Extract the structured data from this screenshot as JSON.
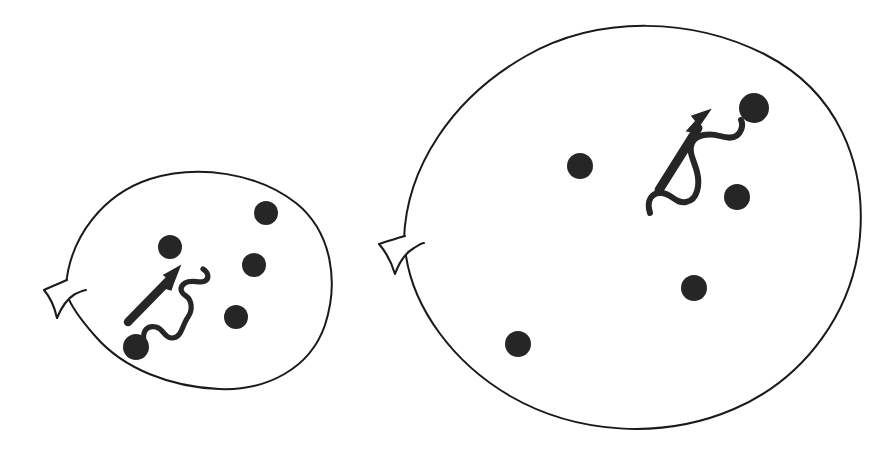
{
  "figure": {
    "background_color": "#ffffff",
    "ink_color": "#1a1a1a",
    "width": 892,
    "height": 453
  },
  "chart_data": {
    "type": "diagram",
    "xlabel": "",
    "ylabel": "",
    "legend": [],
    "annotations": [],
    "cells": [
      {
        "id": "small-cell",
        "label": "small oocyte",
        "shape": "ellipse",
        "center_x": 196,
        "center_y": 280,
        "radius_x": 134,
        "radius_y": 108,
        "rotation_deg": -8,
        "outline_color": "#1a1a1a",
        "outline_width": 2.0,
        "fill_color": "#ffffff",
        "notch": {
          "label": "membrane-notch",
          "x": 62,
          "y": 296,
          "depth": 22,
          "height": 34
        },
        "granules": [
          {
            "cx": 266,
            "cy": 213,
            "r": 12
          },
          {
            "cx": 170,
            "cy": 247,
            "r": 12
          },
          {
            "cx": 254,
            "cy": 265,
            "r": 12
          },
          {
            "cx": 236,
            "cy": 317,
            "r": 12
          },
          {
            "cx": 136,
            "cy": 347,
            "r": 13
          }
        ],
        "motif": {
          "label": "translocation-motif",
          "arrow": {
            "tail_x": 129,
            "tail_y": 321,
            "tip_x": 178,
            "tip_y": 271,
            "stroke_width": 8,
            "head_length": 24,
            "head_width": 20
          },
          "squiggle": {
            "start_x": 145,
            "start_y": 342,
            "end_x": 206,
            "end_y": 284,
            "stroke_width": 5,
            "waves": 3
          }
        }
      },
      {
        "id": "large-cell",
        "label": "large oocyte",
        "shape": "ellipse",
        "center_x": 631,
        "center_y": 227,
        "radius_x": 231,
        "radius_y": 202,
        "rotation_deg": -5,
        "outline_color": "#1a1a1a",
        "outline_width": 2.0,
        "fill_color": "#ffffff",
        "notch": {
          "label": "membrane-notch",
          "x": 400,
          "y": 248,
          "depth": 24,
          "height": 36
        },
        "granules": [
          {
            "cx": 754,
            "cy": 108,
            "r": 15
          },
          {
            "cx": 580,
            "cy": 166,
            "r": 13
          },
          {
            "cx": 737,
            "cy": 197,
            "r": 13
          },
          {
            "cx": 694,
            "cy": 288,
            "r": 13
          },
          {
            "cx": 518,
            "cy": 344,
            "r": 13
          }
        ],
        "motif": {
          "label": "translocation-motif",
          "arrow": {
            "tail_x": 661,
            "tail_y": 189,
            "tip_x": 708,
            "tip_y": 118,
            "stroke_width": 9,
            "head_length": 26,
            "head_width": 22
          },
          "squiggle": {
            "start_x": 648,
            "start_y": 212,
            "end_x": 742,
            "end_y": 122,
            "stroke_width": 6,
            "waves": 3
          }
        }
      }
    ]
  }
}
